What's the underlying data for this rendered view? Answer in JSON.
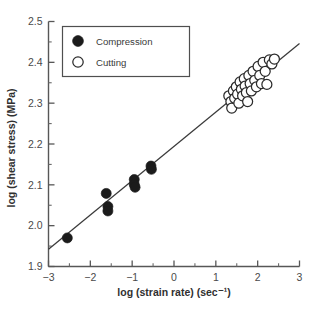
{
  "chart_data": {
    "type": "scatter",
    "title": "",
    "xlabel": "log (strain rate) (sec⁻¹)",
    "ylabel": "log (shear stress) (MPa)",
    "xlim": [
      -3,
      3
    ],
    "ylim": [
      1.9,
      2.5
    ],
    "xticks": [
      -3,
      -2,
      -1,
      0,
      1,
      2,
      3
    ],
    "xticklabels": [
      "−3",
      "−2",
      "−1",
      "0",
      "1",
      "2",
      "3"
    ],
    "yticks": [
      1.9,
      2.0,
      2.1,
      2.2,
      2.3,
      2.4,
      2.5
    ],
    "yticklabels": [
      "1.9",
      "2.0",
      "2.1",
      "2.2",
      "2.3",
      "2.4",
      "2.5"
    ],
    "x_minor_tick_interval": 0.5,
    "y_minor_tick_interval": 0.05,
    "grid": false,
    "legend_position": "upper left inside",
    "series": [
      {
        "name": "Compression",
        "marker": "filled-circle",
        "marker_color": "#1b1b1b",
        "points": [
          [
            -2.55,
            1.97
          ],
          [
            -1.62,
            2.079
          ],
          [
            -1.58,
            2.047
          ],
          [
            -1.58,
            2.036
          ],
          [
            -0.95,
            2.113
          ],
          [
            -0.95,
            2.101
          ],
          [
            -0.93,
            2.094
          ],
          [
            -0.55,
            2.146
          ],
          [
            -0.54,
            2.138
          ]
        ]
      },
      {
        "name": "Cutting",
        "marker": "open-circle",
        "marker_color": "#2b2b2b",
        "points": [
          [
            1.31,
            2.318
          ],
          [
            1.36,
            2.304
          ],
          [
            1.38,
            2.288
          ],
          [
            1.42,
            2.33
          ],
          [
            1.45,
            2.312
          ],
          [
            1.49,
            2.34
          ],
          [
            1.52,
            2.322
          ],
          [
            1.55,
            2.3
          ],
          [
            1.58,
            2.352
          ],
          [
            1.61,
            2.334
          ],
          [
            1.64,
            2.318
          ],
          [
            1.68,
            2.36
          ],
          [
            1.7,
            2.342
          ],
          [
            1.73,
            2.326
          ],
          [
            1.76,
            2.304
          ],
          [
            1.79,
            2.368
          ],
          [
            1.82,
            2.348
          ],
          [
            1.85,
            2.33
          ],
          [
            1.89,
            2.378
          ],
          [
            1.93,
            2.356
          ],
          [
            1.97,
            2.34
          ],
          [
            2.01,
            2.39
          ],
          [
            2.05,
            2.368
          ],
          [
            2.09,
            2.348
          ],
          [
            2.13,
            2.4
          ],
          [
            2.18,
            2.378
          ],
          [
            2.22,
            2.346
          ],
          [
            2.28,
            2.406
          ],
          [
            2.34,
            2.396
          ],
          [
            2.4,
            2.408
          ]
        ]
      }
    ],
    "fit_line": {
      "name": "regression-line",
      "x_start": -3,
      "y_start": 1.942,
      "x_end": 3,
      "y_end": 2.446,
      "slope": 0.084,
      "intercept": 2.194
    }
  },
  "legend": {
    "items": [
      {
        "label": "Compression",
        "marker": "filled-circle"
      },
      {
        "label": "Cutting",
        "marker": "open-circle"
      }
    ]
  },
  "colors": {
    "axis": "#575757",
    "text": "#3a3a3a",
    "line": "#3a3a3a",
    "closed_marker": "#1b1b1b",
    "open_marker": "#2b2b2b",
    "background": "#ffffff"
  }
}
